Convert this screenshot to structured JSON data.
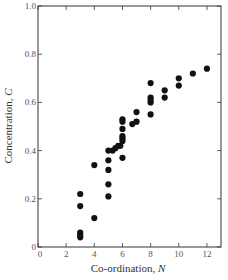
{
  "chart_data": {
    "type": "scatter",
    "title": "",
    "xlabel": "Co-ordination, N",
    "xlabel_main": "Co-ordination, ",
    "xlabel_var": "N",
    "ylabel": "Concentration, C",
    "ylabel_main": "Concentration, ",
    "ylabel_var": "C",
    "xlim": [
      0,
      13
    ],
    "ylim": [
      0,
      1.0
    ],
    "xticks": [
      0,
      2,
      4,
      6,
      8,
      10,
      12
    ],
    "xtick_labels": [
      "0",
      "2",
      "4",
      "6",
      "8",
      "10",
      "12"
    ],
    "yticks": [
      0,
      0.2,
      0.4,
      0.6,
      0.8,
      1.0
    ],
    "ytick_labels": [
      "0",
      "0.2",
      "0.4",
      "0.6",
      "0.8",
      "1.0"
    ],
    "grid": false,
    "legend": null,
    "marker_color": "#111111",
    "points": [
      [
        3,
        0.22
      ],
      [
        3,
        0.17
      ],
      [
        3,
        0.06
      ],
      [
        3,
        0.05
      ],
      [
        3,
        0.04
      ],
      [
        4,
        0.34
      ],
      [
        4,
        0.12
      ],
      [
        5,
        0.4
      ],
      [
        5,
        0.36
      ],
      [
        5,
        0.32
      ],
      [
        5,
        0.26
      ],
      [
        5,
        0.21
      ],
      [
        5.3,
        0.4
      ],
      [
        5.5,
        0.41
      ],
      [
        5.7,
        0.42
      ],
      [
        5.85,
        0.42
      ],
      [
        6,
        0.53
      ],
      [
        6,
        0.52
      ],
      [
        6,
        0.49
      ],
      [
        6,
        0.46
      ],
      [
        6,
        0.45
      ],
      [
        6,
        0.44
      ],
      [
        6,
        0.37
      ],
      [
        6.7,
        0.51
      ],
      [
        7,
        0.52
      ],
      [
        7,
        0.56
      ],
      [
        8,
        0.68
      ],
      [
        8,
        0.62
      ],
      [
        8,
        0.61
      ],
      [
        8,
        0.6
      ],
      [
        8,
        0.55
      ],
      [
        9,
        0.65
      ],
      [
        9,
        0.62
      ],
      [
        10,
        0.7
      ],
      [
        10,
        0.67
      ],
      [
        11,
        0.72
      ],
      [
        12,
        0.74
      ]
    ]
  }
}
